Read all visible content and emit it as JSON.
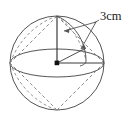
{
  "figure": {
    "name": "sphere-radius-diagram",
    "kind": "geometry-illustration",
    "labels": {
      "radius": "3cm"
    },
    "colors": {
      "outline": "#555555",
      "dashed": "#8a8a8a",
      "radius_line": "#3a3a3a",
      "center_dot": "#111111",
      "label_text": "#1a1a1a",
      "background": "#ffffff"
    },
    "geometry": {
      "sphere_center": [
        57,
        63
      ],
      "sphere_radius": 47,
      "equator_rx": 47,
      "equator_ry": 14,
      "north_pole": [
        57,
        16
      ],
      "south_pole": [
        57,
        110
      ],
      "equator_right": [
        104,
        63
      ],
      "equator_left": [
        10,
        63
      ],
      "vertical_radius": [
        [
          57,
          63
        ],
        [
          57,
          16
        ]
      ],
      "horizontal_radius": [
        [
          57,
          63
        ],
        [
          104,
          63
        ]
      ],
      "meridian_curve": "north-pole to equator-right bulging right"
    },
    "annotation": {
      "leader_origin": [
        96,
        22
      ],
      "arrow_targets": [
        [
          63,
          31
        ],
        [
          80,
          48
        ]
      ],
      "arrow_count": 2,
      "label_position": [
        101,
        20
      ]
    }
  }
}
